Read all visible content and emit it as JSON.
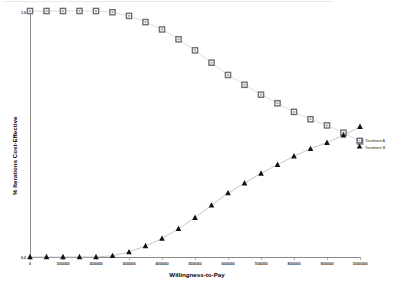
{
  "figure": {
    "background_color": "#ffffff",
    "has_top_rule": true
  },
  "chart_data": {
    "type": "line",
    "title": "",
    "subtitle": "",
    "xlabel": "Willingness-to-Pay",
    "ylabel": "% Iterations Cost-Effective",
    "xlim": [
      0,
      10000000
    ],
    "ylim": [
      0.0,
      1.0
    ],
    "grid": false,
    "legend_position": "right",
    "xticks": [
      0,
      1000000,
      2000000,
      3000000,
      4000000,
      5000000,
      6000000,
      7000000,
      8000000,
      9000000,
      10000000
    ],
    "xtick_labels": [
      "0",
      "1000000",
      "2000000",
      "3000000",
      "4000000",
      "5000000",
      "6000000",
      "7000000",
      "8000000",
      "9000000",
      "10000000"
    ],
    "yticks": [
      0.0,
      1.0
    ],
    "ytick_labels": [
      "0.0",
      "1.0"
    ],
    "x": [
      0,
      500000,
      1000000,
      1500000,
      2000000,
      2500000,
      3000000,
      3500000,
      4000000,
      4500000,
      5000000,
      5500000,
      6000000,
      6500000,
      7000000,
      7500000,
      8000000,
      8500000,
      9000000,
      9500000,
      10000000
    ],
    "series": [
      {
        "name": "Treatment A",
        "marker": "square",
        "marker_face_color": "#ffffff",
        "marker_edge_color": "#6e6e78",
        "line_color": "#d8d8d8",
        "values": [
          1.0,
          1.0,
          1.0,
          1.0,
          1.0,
          0.995,
          0.98,
          0.955,
          0.925,
          0.885,
          0.84,
          0.79,
          0.74,
          0.7,
          0.66,
          0.625,
          0.59,
          0.56,
          0.535,
          0.505,
          0.47
        ]
      },
      {
        "name": "Treatment B",
        "marker": "triangle",
        "marker_face_color": "#121212",
        "marker_edge_color": "#121212",
        "line_color": "#bfbfbf",
        "values": [
          0.0,
          0.0,
          0.0,
          0.0,
          0.0,
          0.005,
          0.02,
          0.045,
          0.075,
          0.115,
          0.16,
          0.21,
          0.26,
          0.3,
          0.34,
          0.375,
          0.41,
          0.44,
          0.465,
          0.495,
          0.53
        ]
      }
    ]
  },
  "legend": {
    "items": [
      {
        "label": "Treatment A",
        "marker": "square"
      },
      {
        "label": "Treatment B",
        "marker": "triangle"
      }
    ]
  }
}
